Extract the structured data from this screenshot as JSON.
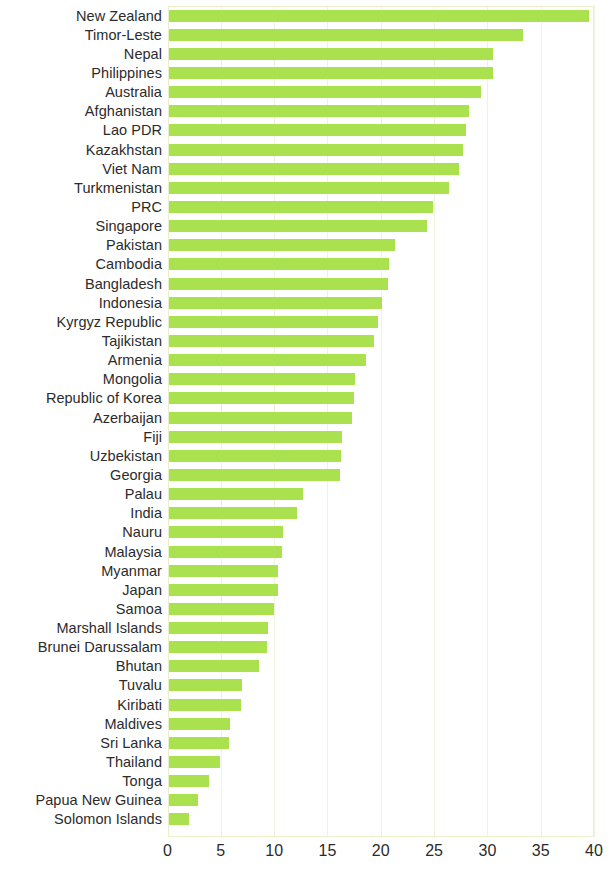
{
  "chart_data": {
    "type": "bar",
    "orientation": "horizontal",
    "title": "",
    "subtitle": "",
    "xlabel": "",
    "ylabel": "",
    "xlim": [
      0,
      40
    ],
    "xticks": [
      0,
      5,
      10,
      15,
      20,
      25,
      30,
      35,
      40
    ],
    "xticklabels": [
      "0",
      "5",
      "10",
      "15",
      "20",
      "25",
      "30",
      "35",
      "40"
    ],
    "grid": true,
    "grid_axis": "x",
    "legend": null,
    "bar_color": "#aae24f",
    "frame_color": "#e9efc8",
    "gridline_color": "#f0f3dc",
    "text_color": "#2b2b2b",
    "categories": [
      "New Zealand",
      "Timor-Leste",
      "Nepal",
      "Philippines",
      "Australia",
      "Afghanistan",
      "Lao PDR",
      "Kazakhstan",
      "Viet Nam",
      "Turkmenistan",
      "PRC",
      "Singapore",
      "Pakistan",
      "Cambodia",
      "Bangladesh",
      "Indonesia",
      "Kyrgyz Republic",
      "Tajikistan",
      "Armenia",
      "Mongolia",
      "Republic of Korea",
      "Azerbaijan",
      "Fiji",
      "Uzbekistan",
      "Georgia",
      "Palau",
      "India",
      "Nauru",
      "Malaysia",
      "Myanmar",
      "Japan",
      "Samoa",
      "Marshall Islands",
      "Brunei Darussalam",
      "Bhutan",
      "Tuvalu",
      "Kiribati",
      "Maldives",
      "Sri Lanka",
      "Thailand",
      "Tonga",
      "Papua New Guinea",
      "Solomon Islands"
    ],
    "values": [
      39.5,
      33.3,
      30.5,
      30.5,
      29.4,
      28.3,
      28.0,
      27.7,
      27.3,
      26.4,
      24.9,
      24.3,
      21.3,
      20.8,
      20.7,
      20.1,
      19.7,
      19.4,
      18.6,
      17.6,
      17.5,
      17.3,
      16.4,
      16.3,
      16.2,
      12.7,
      12.1,
      10.8,
      10.7,
      10.4,
      10.4,
      10.0,
      9.4,
      9.3,
      8.6,
      7.0,
      6.9,
      5.9,
      5.8,
      4.9,
      3.9,
      2.9,
      2.0
    ]
  }
}
